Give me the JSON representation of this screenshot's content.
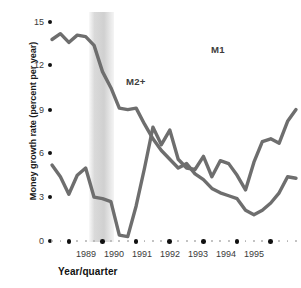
{
  "chart_data": {
    "type": "line",
    "title": "",
    "xlabel": "Year/quarter",
    "ylabel": "Money growth rate (percent per year)",
    "ylim": [
      0,
      15
    ],
    "yticks": [
      0,
      3,
      6,
      9,
      12,
      15
    ],
    "ytick_labels": [
      "0",
      "3",
      "6",
      "9",
      "12",
      "15"
    ],
    "xlim": [
      "1988Q3",
      "1995Q4"
    ],
    "xticks": [
      "1989",
      "1990",
      "1991",
      "1992",
      "1993",
      "1994",
      "1995"
    ],
    "xtick_labels": [
      "1989",
      "1990",
      "1991",
      "1992",
      "1993",
      "1994",
      "1995"
    ],
    "grid": false,
    "legend_position": "inline-annotation",
    "line_color": "#6e6e6e",
    "shaded_region": {
      "label": "recession",
      "x_start": "1989Q2",
      "x_end": "1990Q1",
      "color": "#cdcdcd"
    },
    "annotations": [
      {
        "text": "M2+",
        "x": "1990Q3",
        "y": 10.5
      },
      {
        "text": "M1",
        "x": "1993Q2",
        "y": 13.2
      }
    ],
    "x": [
      "1988Q3",
      "1988Q4",
      "1989Q1",
      "1989Q2",
      "1989Q3",
      "1989Q4",
      "1990Q1",
      "1990Q2",
      "1990Q3",
      "1990Q4",
      "1991Q1",
      "1991Q2",
      "1991Q3",
      "1991Q4",
      "1992Q1",
      "1992Q2",
      "1992Q3",
      "1992Q4",
      "1993Q1",
      "1993Q2",
      "1993Q3",
      "1993Q4",
      "1994Q1",
      "1994Q2",
      "1994Q3",
      "1994Q4",
      "1995Q1",
      "1995Q2",
      "1995Q3",
      "1995Q4"
    ],
    "series": [
      {
        "name": "M2+",
        "values": [
          13.8,
          14.2,
          13.6,
          14.1,
          14.0,
          13.4,
          11.6,
          10.5,
          9.1,
          9.0,
          9.1,
          8.0,
          7.0,
          6.2,
          5.6,
          5.0,
          5.3,
          4.6,
          4.2,
          3.6,
          3.3,
          3.1,
          2.9,
          2.1,
          1.8,
          2.1,
          2.6,
          3.3,
          4.4,
          4.3
        ]
      },
      {
        "name": "M1",
        "values": [
          5.2,
          4.4,
          3.2,
          4.5,
          5.0,
          3.0,
          2.9,
          2.7,
          0.4,
          0.3,
          2.4,
          5.0,
          7.8,
          6.6,
          7.6,
          5.6,
          5.0,
          4.9,
          5.8,
          4.4,
          5.5,
          5.3,
          4.5,
          3.5,
          5.4,
          6.8,
          7.0,
          6.7,
          8.2,
          9.0
        ]
      }
    ]
  },
  "axis": {
    "y_dot_color": "#111111",
    "x_major_dot_color": "#111111",
    "x_minor_dot_color": "#b2b2b2"
  }
}
